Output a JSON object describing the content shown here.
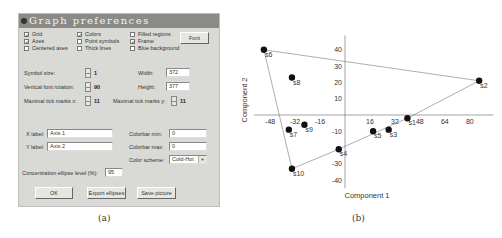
{
  "panel_a": {
    "caption": "(a)",
    "dialog": {
      "title": "Graph preferences",
      "checkboxes": [
        {
          "label": "Grid",
          "checked": true
        },
        {
          "label": "Axes",
          "checked": true
        },
        {
          "label": "Centered axes",
          "checked": false
        },
        {
          "label": "Colors",
          "checked": true
        },
        {
          "label": "Point symbols",
          "checked": false
        },
        {
          "label": "Thick lines",
          "checked": false
        },
        {
          "label": "Filled regions",
          "checked": false
        },
        {
          "label": "Frame",
          "checked": true
        },
        {
          "label": "Blue background",
          "checked": false
        }
      ],
      "font_button": "Font",
      "symbol_size": {
        "label": "Symbol size:",
        "value": "1"
      },
      "vertical_font_rotation": {
        "label": "Vertical font rotation:",
        "value": "90"
      },
      "max_tick_x": {
        "label": "Maximal tick marks x:",
        "value": "11"
      },
      "max_tick_y": {
        "label": "Maximal tick marks y:",
        "value": "11"
      },
      "width": {
        "label": "Width:",
        "value": "372"
      },
      "height": {
        "label": "Height:",
        "value": "377"
      },
      "x_label": {
        "label": "X label:",
        "value": "Axis 1"
      },
      "y_label": {
        "label": "Y label:",
        "value": "Axis 2"
      },
      "colorbar_min": {
        "label": "Colorbar min:",
        "value": "0"
      },
      "colorbar_max": {
        "label": "Colorbar max:",
        "value": "0"
      },
      "color_scheme": {
        "label": "Color scheme:",
        "value": "Cold-Hot"
      },
      "ellipse_level": {
        "label": "Concentration ellipse level (%):",
        "value": "95"
      },
      "buttons": {
        "ok": "OK",
        "export": "Export ellipses",
        "save": "Save picture"
      },
      "check_mark": "✓"
    }
  },
  "panel_b": {
    "caption": "(b)"
  },
  "chart_data": {
    "type": "scatter",
    "title": "",
    "xlabel": "Component 1",
    "ylabel": "Component 2",
    "x_ticks": [
      -48,
      -32,
      -16,
      16,
      32,
      48,
      64,
      80
    ],
    "y_ticks": [
      40,
      30,
      20,
      10,
      -10,
      -30,
      -40
    ],
    "xlim": [
      -55,
      90
    ],
    "ylim": [
      -45,
      50
    ],
    "grid": false,
    "points": [
      {
        "label": "s1",
        "x": 40,
        "y": -2
      },
      {
        "label": "s2",
        "x": 86,
        "y": 21
      },
      {
        "label": "s3",
        "x": 28,
        "y": -9
      },
      {
        "label": "s4",
        "x": -4,
        "y": -21
      },
      {
        "label": "s5",
        "x": 18,
        "y": -10
      },
      {
        "label": "s6",
        "x": -52,
        "y": 40
      },
      {
        "label": "s7",
        "x": -36,
        "y": -9
      },
      {
        "label": "s8",
        "x": -34,
        "y": 23
      },
      {
        "label": "s9",
        "x": -26,
        "y": -6
      },
      {
        "label": "s10",
        "x": -34,
        "y": -33
      }
    ],
    "convex_hull": [
      "s6",
      "s2",
      "s1",
      "s4",
      "s10"
    ]
  }
}
